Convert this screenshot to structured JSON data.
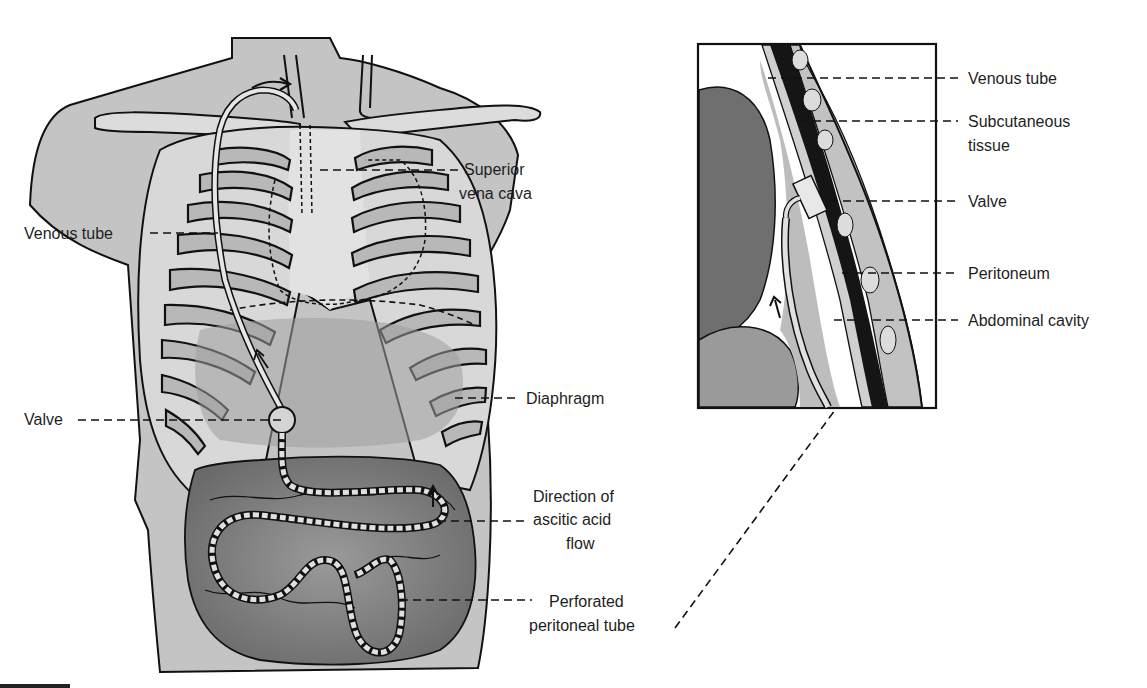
{
  "diagram": {
    "left_panel": {
      "description": "Anterior torso view with rib cage, venous tube and perforated peritoneal tube",
      "labels": [
        {
          "id": "venous_tube",
          "text": "Venous tube"
        },
        {
          "id": "superior_vena_cava_line1",
          "text": "Superior"
        },
        {
          "id": "superior_vena_cava_line2",
          "text": "vena cava"
        },
        {
          "id": "valve",
          "text": "Valve"
        },
        {
          "id": "diaphragm",
          "text": "Diaphragm"
        },
        {
          "id": "direction_line1",
          "text": "Direction of"
        },
        {
          "id": "direction_line2",
          "text": "ascitic acid"
        },
        {
          "id": "direction_line3",
          "text": "flow"
        },
        {
          "id": "perforated_line1",
          "text": "Perforated"
        },
        {
          "id": "perforated_line2",
          "text": "peritoneal tube"
        }
      ]
    },
    "right_panel": {
      "description": "Cross-section inset of abdominal wall showing valve placement",
      "labels": [
        {
          "id": "venous_tube",
          "text": "Venous tube"
        },
        {
          "id": "subcutaneous_line1",
          "text": "Subcutaneous"
        },
        {
          "id": "subcutaneous_line2",
          "text": "tissue"
        },
        {
          "id": "valve",
          "text": "Valve"
        },
        {
          "id": "peritoneum",
          "text": "Peritoneum"
        },
        {
          "id": "abdominal_cavity",
          "text": "Abdominal cavity"
        }
      ]
    },
    "colors": {
      "body_fill": "#c4c4c4",
      "rib_fill": "#dcdcdc",
      "organ_dark": "#8a8a8a",
      "intestine": "#7a7a7a",
      "outline": "#111111",
      "muscle_dark": "#1a1a1a",
      "background": "#ffffff"
    }
  }
}
